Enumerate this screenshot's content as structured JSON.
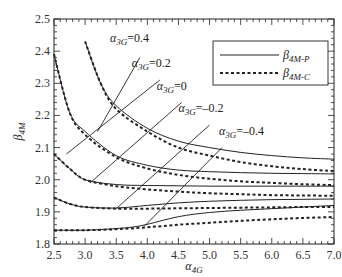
{
  "chart_data": {
    "type": "line",
    "title": "",
    "xlabel": "α4G",
    "xlabel_main": "α",
    "xlabel_sub": "4G",
    "ylabel": "β4M",
    "ylabel_main": "β",
    "ylabel_sub": "4M",
    "xlim": [
      2.5,
      7.0
    ],
    "ylim": [
      1.8,
      2.5
    ],
    "xticks": [
      "2.5",
      "3.0",
      "3.5",
      "4.0",
      "4.5",
      "5.0",
      "5.5",
      "6.0",
      "6.5",
      "7.0"
    ],
    "yticks": [
      "1.8",
      "1.9",
      "2.0",
      "2.1",
      "2.2",
      "2.3",
      "2.4",
      "2.5"
    ],
    "grid": false,
    "legend": {
      "position": "upper right",
      "entries": [
        {
          "main": "β",
          "sub": "4M-P",
          "label": "β4M-P",
          "style": "solid"
        },
        {
          "main": "β",
          "sub": "4M-C",
          "label": "β4M-C",
          "style": "dashed"
        }
      ]
    },
    "series": [
      {
        "name": "α3G=0.4 β4M-P",
        "style": "solid",
        "x": [
          3.0,
          3.25,
          3.5,
          4.0,
          4.5,
          5.0,
          5.5,
          6.0,
          6.5,
          7.0
        ],
        "y": [
          2.43,
          2.3,
          2.23,
          2.16,
          2.12,
          2.1,
          2.085,
          2.075,
          2.068,
          2.064
        ]
      },
      {
        "name": "α3G=0.4 β4M-C",
        "style": "dashed",
        "x": [
          3.0,
          3.25,
          3.5,
          4.0,
          4.5,
          5.0,
          5.5,
          6.0,
          6.5,
          7.0
        ],
        "y": [
          2.43,
          2.3,
          2.22,
          2.15,
          2.1,
          2.075,
          2.055,
          2.042,
          2.033,
          2.027
        ]
      },
      {
        "name": "α3G=0.2 β4M-P",
        "style": "solid",
        "x": [
          2.5,
          2.75,
          3.0,
          3.5,
          4.0,
          4.5,
          5.0,
          5.5,
          6.0,
          6.5,
          7.0
        ],
        "y": [
          2.39,
          2.21,
          2.15,
          2.075,
          2.045,
          2.03,
          2.025,
          2.022,
          2.02,
          2.019,
          2.018
        ]
      },
      {
        "name": "α3G=0.2 β4M-C",
        "style": "dashed",
        "x": [
          2.5,
          2.75,
          3.0,
          3.5,
          4.0,
          4.5,
          5.0,
          5.5,
          6.0,
          6.5,
          7.0
        ],
        "y": [
          2.39,
          2.21,
          2.14,
          2.07,
          2.035,
          2.015,
          2.003,
          1.995,
          1.99,
          1.986,
          1.983
        ]
      },
      {
        "name": "α3G=0 β4M-P",
        "style": "solid",
        "x": [
          2.5,
          2.75,
          3.0,
          3.5,
          4.0,
          4.5,
          5.0,
          5.5,
          6.0,
          6.5,
          7.0
        ],
        "y": [
          2.08,
          2.035,
          2.0,
          1.985,
          1.982,
          1.981,
          1.98,
          1.98,
          1.98,
          1.98,
          1.98
        ]
      },
      {
        "name": "α3G=0 β4M-C",
        "style": "dashed",
        "x": [
          2.5,
          2.75,
          3.0,
          3.5,
          4.0,
          4.5,
          5.0,
          5.5,
          6.0,
          6.5,
          7.0
        ],
        "y": [
          2.08,
          2.035,
          2.0,
          1.98,
          1.97,
          1.963,
          1.958,
          1.955,
          1.952,
          1.951,
          1.95
        ]
      },
      {
        "name": "α3G=-0.2 β4M-P",
        "style": "solid",
        "x": [
          2.5,
          2.75,
          3.0,
          3.5,
          4.0,
          4.5,
          5.0,
          5.5,
          6.0,
          6.5,
          7.0
        ],
        "y": [
          1.945,
          1.925,
          1.915,
          1.912,
          1.92,
          1.928,
          1.933,
          1.936,
          1.938,
          1.939,
          1.94
        ]
      },
      {
        "name": "α3G=-0.2 β4M-C",
        "style": "dashed",
        "x": [
          2.5,
          2.75,
          3.0,
          3.5,
          4.0,
          4.5,
          5.0,
          5.5,
          6.0,
          6.5,
          7.0
        ],
        "y": [
          1.945,
          1.925,
          1.915,
          1.91,
          1.91,
          1.911,
          1.912,
          1.913,
          1.914,
          1.915,
          1.915
        ]
      },
      {
        "name": "α3G=-0.4 β4M-P",
        "style": "solid",
        "x": [
          2.5,
          3.0,
          3.5,
          3.9,
          4.5,
          5.0,
          5.5,
          6.0,
          6.5,
          7.0
        ],
        "y": [
          1.843,
          1.843,
          1.848,
          1.857,
          1.885,
          1.898,
          1.905,
          1.91,
          1.915,
          1.92
        ]
      },
      {
        "name": "α3G=-0.4 β4M-C",
        "style": "dashed",
        "x": [
          2.5,
          3.0,
          3.5,
          4.0,
          4.5,
          5.0,
          5.5,
          6.0,
          6.5,
          7.0
        ],
        "y": [
          1.843,
          1.843,
          1.846,
          1.852,
          1.86,
          1.866,
          1.872,
          1.877,
          1.881,
          1.884
        ]
      }
    ],
    "annotations": [
      {
        "label": "α3G=0.4",
        "main": "α",
        "sub": "3G",
        "value": "=0.4",
        "text_pos": [
          3.4,
          2.43
        ],
        "line": [
          [
            3.2,
            2.15
          ],
          [
            3.88,
            2.38
          ]
        ]
      },
      {
        "label": "α3G=0.2",
        "main": "α",
        "sub": "3G",
        "value": "=0.2",
        "text_pos": [
          3.75,
          2.35
        ],
        "line": [
          [
            2.7,
            2.08
          ],
          [
            4.2,
            2.31
          ]
        ]
      },
      {
        "label": "α3G=0",
        "main": "α",
        "sub": "3G",
        "value": "=0",
        "text_pos": [
          4.15,
          2.28
        ],
        "line": [
          [
            3.08,
            1.99
          ],
          [
            4.55,
            2.24
          ]
        ]
      },
      {
        "label": "α3G=-0.2",
        "main": "α",
        "sub": "3G",
        "value": "=-0.2",
        "text_pos": [
          4.5,
          2.21
        ],
        "line": [
          [
            3.5,
            1.91
          ],
          [
            5.0,
            2.17
          ]
        ]
      },
      {
        "label": "α3G=-0.4",
        "main": "α",
        "sub": "3G",
        "value": "=-0.4",
        "text_pos": [
          5.15,
          2.14
        ],
        "line": [
          [
            3.95,
            1.855
          ],
          [
            5.2,
            2.1
          ]
        ]
      }
    ]
  }
}
